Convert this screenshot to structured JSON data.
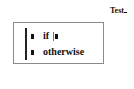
{
  "document": {
    "title": "Test"
  },
  "piecewise": {
    "cases": [
      {
        "value_placeholder": "■",
        "condition_label": "if",
        "condition_placeholder": "■",
        "has_cursor": true
      },
      {
        "value_placeholder": "■",
        "condition_label": "otherwise"
      }
    ]
  },
  "colors": {
    "box_border": "#8a8a8a",
    "text": "#111111"
  }
}
